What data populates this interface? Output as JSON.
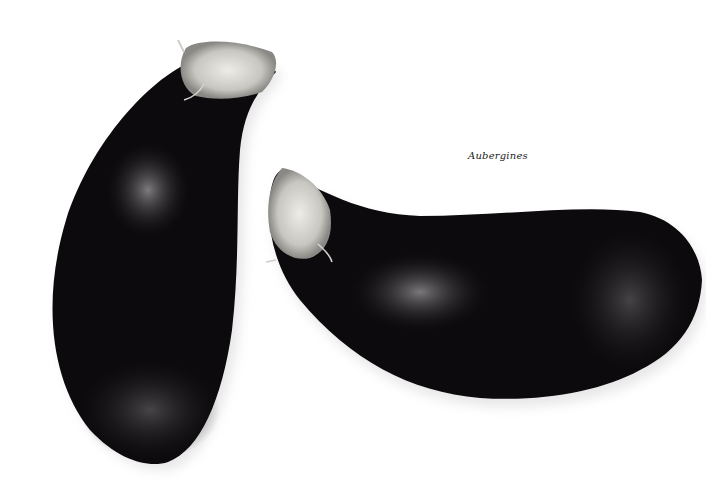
{
  "caption": "Aubergines",
  "scene": {
    "background_color": "#ffffff",
    "subjects": [
      {
        "name": "aubergine-left",
        "orientation": "vertical, stem top-right",
        "skin_color": "#0c0a0c",
        "highlight_color": "#5a585a",
        "calyx_color": "#d8d6d0"
      },
      {
        "name": "aubergine-right",
        "orientation": "horizontal, stem left",
        "skin_color": "#0c0a0c",
        "highlight_color": "#5e5c5e",
        "calyx_color": "#d4d2cc"
      }
    ]
  }
}
